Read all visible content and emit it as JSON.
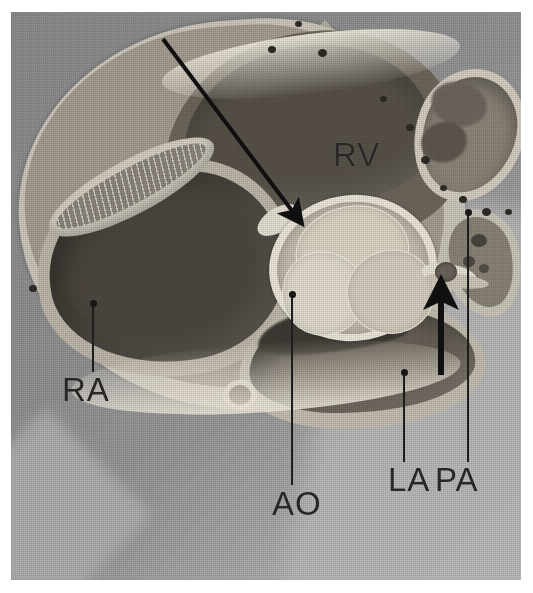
{
  "figure": {
    "kind": "anatomical-illustration",
    "rendering": "grayscale halftone print",
    "background_color": "#9a9a9a",
    "plate_border_color": "#ffffff"
  },
  "labels": [
    {
      "id": "rv",
      "text": "RV",
      "meaning": "right ventricle",
      "x": 333,
      "y": 138,
      "has_leader": false
    },
    {
      "id": "ra",
      "text": "RA",
      "meaning": "right atrium",
      "x": 62,
      "y": 373,
      "has_leader": true
    },
    {
      "id": "ao",
      "text": "AO",
      "meaning": "aorta / aortic valve",
      "x": 272,
      "y": 487,
      "has_leader": true
    },
    {
      "id": "la",
      "text": "LA",
      "meaning": "left atrium",
      "x": 388,
      "y": 463,
      "has_leader": true
    },
    {
      "id": "pa",
      "text": "PA",
      "meaning": "pulmonary artery",
      "x": 435,
      "y": 463,
      "has_leader": true
    }
  ],
  "leaders": [
    {
      "id": "leader-ra",
      "for": "RA",
      "x": 92,
      "y_top": 303,
      "y_bottom": 372,
      "dot_at": "top"
    },
    {
      "id": "leader-ao",
      "for": "AO",
      "x": 291,
      "y_top": 294,
      "y_bottom": 485,
      "dot_at": "top"
    },
    {
      "id": "leader-la",
      "for": "LA",
      "x": 403,
      "y_top": 372,
      "y_bottom": 462,
      "dot_at": "top"
    },
    {
      "id": "leader-pa",
      "for": "PA",
      "x": 467,
      "y_top": 212,
      "y_bottom": 462,
      "dot_at": "top"
    }
  ],
  "arrows": [
    {
      "id": "arrow-diagonal",
      "direction": "down-right",
      "points_at": "membranous septum / aortic-root junction",
      "x1": 163,
      "y1": 39,
      "x2": 293,
      "y2": 212,
      "color": "#111111",
      "shaft_width": 4
    },
    {
      "id": "arrow-vertical",
      "direction": "up",
      "points_at": "aortic-pulmonary junction nodule",
      "x1": 441,
      "y1": 375,
      "x2": 441,
      "y2": 298,
      "color": "#111111",
      "shaft_width": 6
    }
  ],
  "epicardial_dots": [
    {
      "x": 298,
      "y": 24
    },
    {
      "x": 272,
      "y": 50
    },
    {
      "x": 322,
      "y": 53
    },
    {
      "x": 383,
      "y": 99
    },
    {
      "x": 410,
      "y": 128
    },
    {
      "x": 425,
      "y": 160
    },
    {
      "x": 443,
      "y": 188
    },
    {
      "x": 463,
      "y": 200
    },
    {
      "x": 486,
      "y": 212
    },
    {
      "x": 508,
      "y": 212
    },
    {
      "x": 33,
      "y": 289
    }
  ],
  "structures": [
    {
      "id": "rv-cavity",
      "name": "right ventricular cavity",
      "tone": "#585249"
    },
    {
      "id": "ra-cavity",
      "name": "right atrial cavity",
      "tone": "#4e4840"
    },
    {
      "id": "la-cavity",
      "name": "left atrial cavity",
      "tone": "#6a6359"
    },
    {
      "id": "ao-root",
      "name": "aortic root",
      "tone": "#c9c2b3"
    },
    {
      "id": "cusp-top",
      "name": "aortic valve cusp (non-coronary)",
      "tone": "#ded7c7"
    },
    {
      "id": "cusp-left",
      "name": "aortic valve cusp (left coronary)",
      "tone": "#e4ded0"
    },
    {
      "id": "cusp-right",
      "name": "aortic valve cusp (right coronary)",
      "tone": "#d8d1c2"
    },
    {
      "id": "pa-cavity",
      "name": "pulmonary artery lumen",
      "tone": "#8e877b"
    },
    {
      "id": "ra-appendage",
      "name": "right atrial appendage pectinate ridge",
      "tone": "#8d867b"
    },
    {
      "id": "rca",
      "name": "adjacent vessel / coronary sinus",
      "tone": "#8b8479"
    }
  ]
}
